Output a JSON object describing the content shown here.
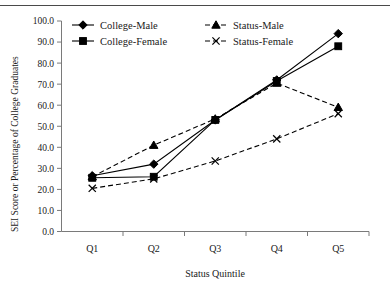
{
  "chart_data": {
    "type": "line",
    "title": "",
    "xlabel": "Status Quintile",
    "ylabel": "SEI Score or Percentage of College Graduates",
    "categories": [
      "Q1",
      "Q2",
      "Q3",
      "Q4",
      "Q5"
    ],
    "ylim": [
      0.0,
      100.0
    ],
    "ytick_labels": [
      "0.0",
      "10.0",
      "20.0",
      "30.0",
      "40.0",
      "50.0",
      "60.0",
      "70.0",
      "80.0",
      "90.0",
      "100.0"
    ],
    "ytick_values": [
      0,
      10,
      20,
      30,
      40,
      50,
      60,
      70,
      80,
      90,
      100
    ],
    "grid": false,
    "legend_position": "top-left-inside",
    "series": [
      {
        "name": "College-Male",
        "marker": "diamond",
        "line_style": "solid",
        "values": [
          26.5,
          32.0,
          53.0,
          72.0,
          94.0
        ]
      },
      {
        "name": "College-Female",
        "marker": "square",
        "line_style": "solid",
        "values": [
          25.5,
          26.0,
          53.0,
          71.5,
          88.0
        ]
      },
      {
        "name": "Status-Male",
        "marker": "triangle",
        "line_style": "dashed",
        "values": [
          26.0,
          41.0,
          53.5,
          70.5,
          59.0
        ]
      },
      {
        "name": "Status-Female",
        "marker": "x",
        "line_style": "dashed",
        "values": [
          20.5,
          25.0,
          33.5,
          44.0,
          56.0
        ]
      }
    ]
  },
  "legend": {
    "entries": [
      {
        "label": "College-Male"
      },
      {
        "label": "Status-Male"
      },
      {
        "label": "College-Female"
      },
      {
        "label": "Status-Female"
      }
    ]
  }
}
